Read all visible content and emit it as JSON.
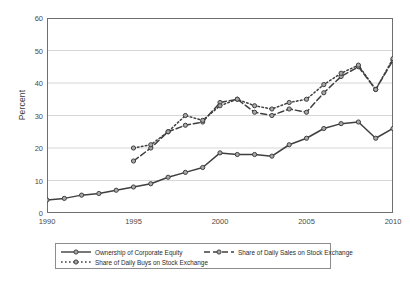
{
  "chart_data": {
    "type": "line",
    "title": "",
    "xlabel": "",
    "ylabel": "Percent",
    "xlim": [
      1990,
      2010
    ],
    "ylim": [
      0,
      60
    ],
    "xticks": [
      1990,
      1995,
      2000,
      2005,
      2010
    ],
    "yticks": [
      0,
      10,
      20,
      30,
      40,
      50,
      60
    ],
    "grid": "horizontal",
    "legend_position": "below-axes",
    "x": [
      1990,
      1991,
      1992,
      1993,
      1994,
      1995,
      1996,
      1997,
      1998,
      1999,
      2000,
      2001,
      2002,
      2003,
      2004,
      2005,
      2006,
      2007,
      2008,
      2009,
      2010
    ],
    "series": [
      {
        "name": "Ownership of Corporate Equity",
        "style": "solid",
        "marker": "circle",
        "color": "#3f3f3f",
        "x": [
          1990,
          1991,
          1992,
          1993,
          1994,
          1995,
          1996,
          1997,
          1998,
          1999,
          2000,
          2001,
          2002,
          2003,
          2004,
          2005,
          2006,
          2007,
          2008,
          2009,
          2010
        ],
        "values": [
          4,
          4.5,
          5.5,
          6,
          7,
          8,
          9,
          11,
          12.5,
          14,
          18.5,
          18,
          18,
          17.5,
          21,
          23,
          26,
          27.5,
          28,
          23,
          26
        ]
      },
      {
        "name": "Share of Daily Sales on Stock Exchange",
        "style": "dashed",
        "marker": "circle",
        "color": "#3f3f3f",
        "x": [
          1995,
          1996,
          1997,
          1998,
          1999,
          2000,
          2001,
          2002,
          2003,
          2004,
          2005,
          2006,
          2007,
          2008,
          2009,
          2010
        ],
        "values": [
          16,
          20,
          25,
          27,
          28,
          34,
          35,
          31,
          30,
          32,
          31,
          37,
          42,
          45,
          38,
          47
        ]
      },
      {
        "name": "Share of Daily Buys on Stock Exchange",
        "style": "dotted",
        "marker": "circle",
        "color": "#3f3f3f",
        "x": [
          1995,
          1996,
          1997,
          1998,
          1999,
          2000,
          2001,
          2002,
          2003,
          2004,
          2005,
          2006,
          2007,
          2008,
          2009,
          2010
        ],
        "values": [
          20,
          21,
          25,
          30,
          28.5,
          33,
          35,
          33,
          32,
          34,
          35,
          39.5,
          43,
          45.5,
          38,
          47.5
        ]
      }
    ]
  },
  "axes": {
    "ylabel": "Percent",
    "yticklabels": [
      "0",
      "10",
      "20",
      "30",
      "40",
      "50",
      "60"
    ],
    "xticklabels": [
      "1990",
      "1995",
      "2000",
      "2005",
      "2010"
    ]
  },
  "legend": {
    "items": [
      {
        "label": "Ownership of Corporate Equity",
        "style": "solid"
      },
      {
        "label": "Share of Daily Sales on Stock Exchange",
        "style": "dashed"
      },
      {
        "label": "Share of Daily Buys on Stock Exchange",
        "style": "dotted"
      }
    ]
  },
  "colors": {
    "line": "#3f3f3f",
    "marker_fill": "#a8a8a8",
    "grid": "#d6d6d6",
    "frame": "#6f6f6f",
    "text": "#3a3a3a"
  }
}
